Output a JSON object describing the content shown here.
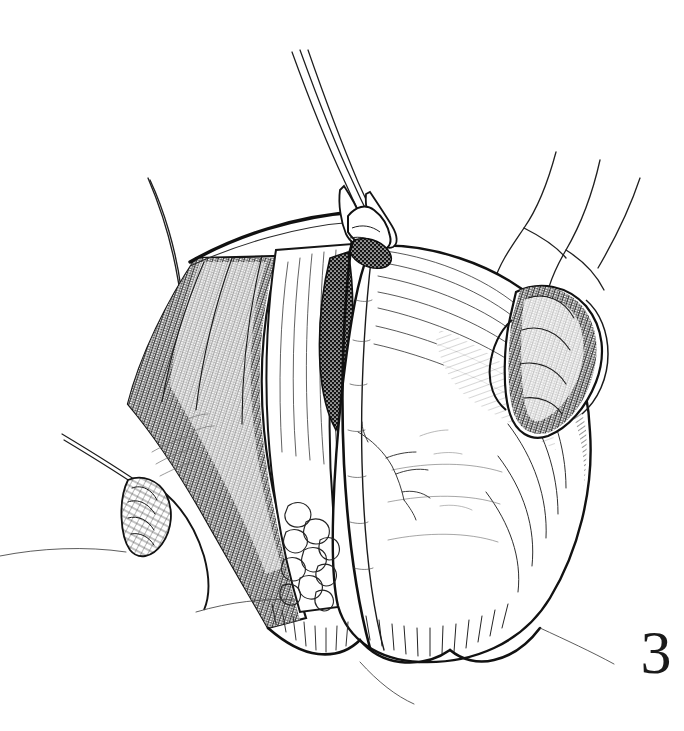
{
  "figure": {
    "number_label": "3",
    "caption_text": "",
    "style": "pen-and-ink line drawing",
    "medium": "black ink hatching and stipple on white",
    "background_color": "#ffffff",
    "ink_color": "#1a1a1a",
    "canvas": {
      "width": 684,
      "height": 731
    }
  },
  "illustration": {
    "title": "",
    "subject": "surgical field with tissue mass elevated by forceps",
    "elements": [
      {
        "name": "forceps",
        "label": "",
        "description": "long slender three-line instrument shaft entering from top, tips grasping a tented fold of tissue at the apex",
        "position": "top-center",
        "anchor_x": 360,
        "anchor_y": 220
      },
      {
        "name": "tissue-mass",
        "label": "",
        "description": "large rounded mass occupying the center of the field, shaded with parallel hatching",
        "position": "center",
        "anchor_x": 380,
        "anchor_y": 420
      },
      {
        "name": "central-ridge",
        "label": "",
        "description": "vertical raised midline ridge running from apex toward bottom",
        "position": "center",
        "anchor_x": 365,
        "anchor_y": 400
      },
      {
        "name": "left-shadow-recess",
        "label": "",
        "description": "dark stippled recess left of the midline ridge",
        "position": "center-left",
        "anchor_x": 330,
        "anchor_y": 310
      },
      {
        "name": "right-shadow-recess",
        "label": "",
        "description": "dark stippled recess right of the midline ridge",
        "position": "center-right",
        "anchor_x": 430,
        "anchor_y": 320
      },
      {
        "name": "left-retracted-flap",
        "label": "",
        "description": "retracted tissue flap on the left with dense cross-hatched shading",
        "position": "left",
        "anchor_x": 220,
        "anchor_y": 380
      },
      {
        "name": "tubular-structure",
        "label": "",
        "description": "curved tubular anatomical structure on the right flank, cross-hatched",
        "position": "right",
        "anchor_x": 560,
        "anchor_y": 330
      },
      {
        "name": "lower-left-retractor",
        "label": "",
        "description": "small retractor instrument with hatched blade entering from lower left",
        "position": "lower-left",
        "anchor_x": 130,
        "anchor_y": 490
      },
      {
        "name": "nodular-texture-patch",
        "label": "",
        "description": "cluster of small rounded nodules drawn with outline loops on the lower-left of the mass",
        "position": "lower-center-left",
        "anchor_x": 310,
        "anchor_y": 545
      },
      {
        "name": "vascular-branches",
        "label": "",
        "description": "fine branching vessel lines on the face of the mass",
        "position": "center-right",
        "anchor_x": 400,
        "anchor_y": 450
      },
      {
        "name": "upper-right-skin-fold",
        "label": "",
        "description": "soft contour lines of skin folds retracted at upper right",
        "position": "upper-right",
        "anchor_x": 580,
        "anchor_y": 200
      },
      {
        "name": "upper-left-skin-edge",
        "label": "",
        "description": "thin contour line of retracted skin edge at upper left",
        "position": "upper-left",
        "anchor_x": 180,
        "anchor_y": 200
      },
      {
        "name": "lower-scalloped-margin",
        "label": "",
        "description": "scalloped lower margin of the mass with short dense hatch strokes",
        "position": "bottom",
        "anchor_x": 400,
        "anchor_y": 630
      }
    ]
  }
}
